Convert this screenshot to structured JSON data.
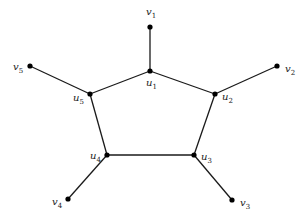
{
  "diagram": {
    "type": "graph",
    "nodes": [
      {
        "id": "v1",
        "base": "v",
        "sub": "1",
        "x": 150,
        "y": 27,
        "label_x": 146,
        "label_y": 15
      },
      {
        "id": "u1",
        "base": "u",
        "sub": "1",
        "x": 150,
        "y": 71,
        "label_x": 146,
        "label_y": 86
      },
      {
        "id": "v2",
        "base": "v",
        "sub": "2",
        "x": 277,
        "y": 66,
        "label_x": 285,
        "label_y": 72
      },
      {
        "id": "u2",
        "base": "u",
        "sub": "2",
        "x": 215,
        "y": 94,
        "label_x": 222,
        "label_y": 100
      },
      {
        "id": "v3",
        "base": "v",
        "sub": "3",
        "x": 232,
        "y": 200,
        "label_x": 240,
        "label_y": 206
      },
      {
        "id": "u3",
        "base": "u",
        "sub": "3",
        "x": 194,
        "y": 155,
        "label_x": 201,
        "label_y": 160
      },
      {
        "id": "v4",
        "base": "v",
        "sub": "4",
        "x": 68,
        "y": 199,
        "label_x": 52,
        "label_y": 205
      },
      {
        "id": "u4",
        "base": "u",
        "sub": "4",
        "x": 107,
        "y": 155,
        "label_x": 90,
        "label_y": 159
      },
      {
        "id": "v5",
        "base": "v",
        "sub": "5",
        "x": 30,
        "y": 66,
        "label_x": 13,
        "label_y": 70
      },
      {
        "id": "u5",
        "base": "u",
        "sub": "5",
        "x": 90,
        "y": 94,
        "label_x": 73,
        "label_y": 101
      }
    ],
    "edges": [
      {
        "from": "u1",
        "to": "u2"
      },
      {
        "from": "u2",
        "to": "u3"
      },
      {
        "from": "u3",
        "to": "u4"
      },
      {
        "from": "u4",
        "to": "u5"
      },
      {
        "from": "u5",
        "to": "u1"
      },
      {
        "from": "u1",
        "to": "v1"
      },
      {
        "from": "u2",
        "to": "v2"
      },
      {
        "from": "u3",
        "to": "v3"
      },
      {
        "from": "u4",
        "to": "v4"
      },
      {
        "from": "u5",
        "to": "v5"
      }
    ],
    "style": {
      "edge_color": "#1a1a1a",
      "node_color": "#000000",
      "label_color": "#222222",
      "background": "#ffffff",
      "node_radius": 2.6
    }
  }
}
